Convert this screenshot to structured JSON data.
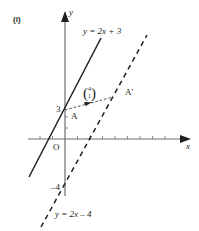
{
  "figure": {
    "part_label": "(i)",
    "axes": {
      "x_label": "x",
      "y_label": "y",
      "origin_label": "O"
    },
    "y_intercept_labels": {
      "upper": "3",
      "lower": "–4"
    },
    "lines": [
      {
        "equation": "y = 2x + 3",
        "style": "solid"
      },
      {
        "equation": "y = 2x – 4",
        "style": "dashed"
      }
    ],
    "points": {
      "A": "A",
      "A_prime": "A'"
    },
    "translation_vector": {
      "top": "4",
      "bottom": "1"
    },
    "colors": {
      "ink": "#231f20",
      "axis": "#6d6e71"
    }
  }
}
